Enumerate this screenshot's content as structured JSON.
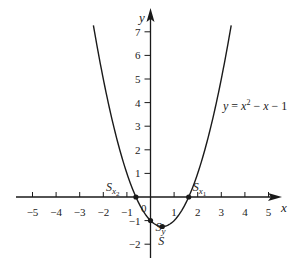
{
  "chart_data": {
    "type": "line",
    "title": "",
    "equation_label": "y = x² − x − 1",
    "function": "x^2 - x - 1",
    "xlabel": "x",
    "ylabel": "y",
    "xlim": [
      -5.6,
      5.8
    ],
    "ylim": [
      -2.4,
      7.4
    ],
    "x_ticks": [
      -5,
      -4,
      -3,
      -2,
      -1,
      1,
      2,
      3,
      4,
      5
    ],
    "y_ticks": [
      -2,
      -1,
      1,
      2,
      3,
      4,
      5,
      6,
      7
    ],
    "x_tick_labels": [
      "−5",
      "−4",
      "−3",
      "−2",
      "−1",
      "1",
      "2",
      "3",
      "4",
      "5"
    ],
    "y_tick_labels": [
      "−2",
      "−1",
      "1",
      "2",
      "3",
      "4",
      "5",
      "6",
      "7"
    ],
    "origin_label": "0",
    "grid": false,
    "curve_x_range": [
      -2.42,
      3.42
    ],
    "points": [
      {
        "name": "S_x2",
        "label": "S",
        "sub": "x",
        "subsub": "2",
        "x": -0.618,
        "y": 0
      },
      {
        "name": "S_x1",
        "label": "S",
        "sub": "x",
        "subsub": "1",
        "x": 1.618,
        "y": 0
      },
      {
        "name": "S_y",
        "label": "S",
        "sub": "y",
        "subsub": "",
        "x": 0,
        "y": -1
      },
      {
        "name": "S",
        "label": "S",
        "sub": "",
        "subsub": "",
        "x": 0.5,
        "y": -1.25
      }
    ],
    "colors": {
      "axis": "#1a1a1a",
      "curve": "#1a1a1a",
      "text": "#222222"
    }
  }
}
